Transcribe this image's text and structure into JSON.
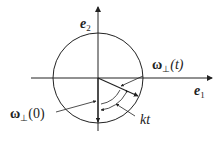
{
  "diagram": {
    "axes": {
      "x_label": "e",
      "x_label_sub": "1",
      "y_label": "e",
      "y_label_sub": "2"
    },
    "circle": {
      "cx": 98,
      "cy": 78,
      "r": 45
    },
    "vectors": [
      {
        "name": "omega_perp_t",
        "label": "ω",
        "sub": "⊥",
        "arg": "(t)"
      },
      {
        "name": "omega_perp_0",
        "label": "ω",
        "sub": "⊥",
        "arg": "(0)"
      }
    ],
    "angle_label": "kt",
    "colors": {
      "stroke": "#222222",
      "background": "#ffffff"
    }
  }
}
